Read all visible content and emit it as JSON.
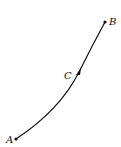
{
  "diagram": {
    "type": "curve-path",
    "points": [
      {
        "id": "A",
        "label": "A",
        "x": 16,
        "y": 139
      },
      {
        "id": "C",
        "label": "C",
        "x": 79,
        "y": 72
      },
      {
        "id": "B",
        "label": "B",
        "x": 105,
        "y": 22
      }
    ],
    "curve": {
      "from": "A",
      "to": "B",
      "through": "C",
      "direction": "A-to-B",
      "arrow_at": "C"
    },
    "colors": {
      "stroke": "#111111",
      "background": "#ffffff"
    }
  }
}
